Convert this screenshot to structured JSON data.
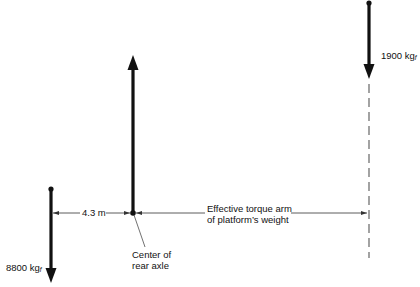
{
  "forces": [
    {
      "id": "rear-load",
      "magnitude": "8800",
      "unit": "kg",
      "subscript": "f",
      "direction": "down"
    },
    {
      "id": "axle-support",
      "direction": "up"
    },
    {
      "id": "platform-weight",
      "magnitude": "1900",
      "unit": "kg",
      "subscript": "f",
      "direction": "down"
    }
  ],
  "labels": {
    "rear_load": "8800 kg",
    "rear_load_sub": "f",
    "platform_weight": "1900 kg",
    "platform_weight_sub": "f",
    "distance": "4.3 m",
    "torque_arm_line1": "Effective torque arm",
    "torque_arm_line2": "of platform’s weight",
    "axle_line1": "Center of",
    "axle_line2": "rear axle"
  },
  "colors": {
    "ink": "#111111",
    "dashed": "#666666",
    "thin": "#333333"
  }
}
